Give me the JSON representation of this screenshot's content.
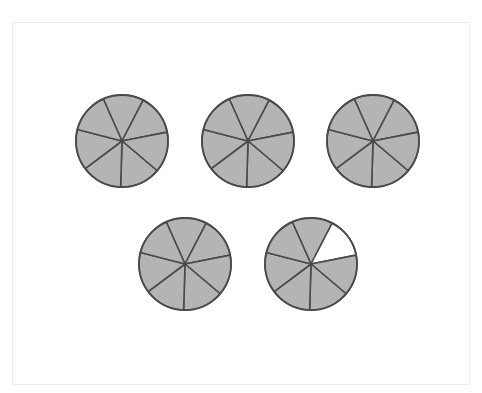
{
  "figure": {
    "parts_per_circle": 7,
    "start_angle_deg": -114,
    "radius": 46,
    "colors": {
      "shaded": "#b4b4b4",
      "unshaded": "#ffffff",
      "stroke": "#4a4a4a"
    },
    "circles": [
      {
        "cx": 122,
        "cy": 141,
        "shaded": [
          true,
          true,
          true,
          true,
          true,
          true,
          true
        ]
      },
      {
        "cx": 248,
        "cy": 141,
        "shaded": [
          true,
          true,
          true,
          true,
          true,
          true,
          true
        ]
      },
      {
        "cx": 373,
        "cy": 141,
        "shaded": [
          true,
          true,
          true,
          true,
          true,
          true,
          true
        ]
      },
      {
        "cx": 185,
        "cy": 264,
        "shaded": [
          true,
          true,
          true,
          true,
          true,
          true,
          true
        ]
      },
      {
        "cx": 311,
        "cy": 264,
        "shaded": [
          true,
          false,
          true,
          true,
          true,
          true,
          true
        ]
      }
    ],
    "total_shaded_parts": 34,
    "fraction": "34/7"
  }
}
